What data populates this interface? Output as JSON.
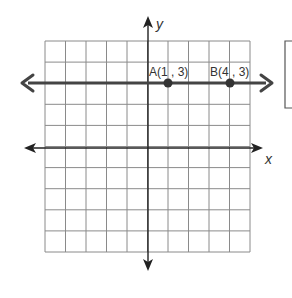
{
  "diagram": {
    "type": "coordinate-plane",
    "grid": {
      "cols": 10,
      "rows": 10,
      "left": 45,
      "top": 41,
      "right": 250,
      "bottom": 252,
      "color": "#8a8a8a"
    },
    "axes": {
      "x_label": "x",
      "y_label": "y",
      "origin_px": [
        148,
        148
      ],
      "color": "#222222"
    },
    "line": {
      "description": "horizontal line y = 3",
      "y_px": 83,
      "x_start_px": 22,
      "x_end_px": 272,
      "color": "#444444"
    },
    "points": [
      {
        "name": "A",
        "label": "A(1 , 3)",
        "x": 1,
        "y": 3,
        "px": [
          168,
          83
        ]
      },
      {
        "name": "B",
        "label": "B(4 , 3)",
        "x": 4,
        "y": 3,
        "px": [
          230,
          83
        ]
      }
    ],
    "side_box": {
      "left": 285,
      "top": 41,
      "bottom": 108
    }
  }
}
